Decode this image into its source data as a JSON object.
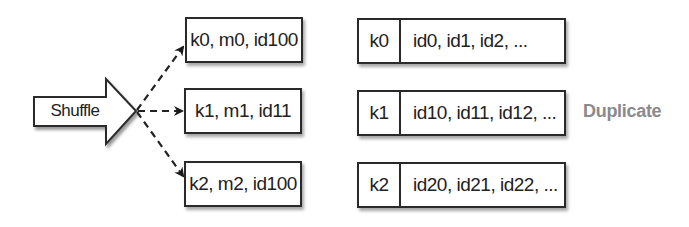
{
  "diagram": {
    "source": {
      "label": "Shuffle",
      "shape": "block-arrow-right"
    },
    "connectors": {
      "style": "dashed",
      "color": "#222222",
      "targets": [
        "record-0",
        "record-1",
        "record-2"
      ]
    },
    "records": [
      {
        "id": "record-0",
        "label": "k0, m0, id100"
      },
      {
        "id": "record-1",
        "label": "k1, m1, id11"
      },
      {
        "id": "record-2",
        "label": "k2, m2, id100"
      }
    ],
    "groups": [
      {
        "key": "k0",
        "values": "id0, id1, id2, ..."
      },
      {
        "key": "k1",
        "values": "id10, id11, id12, ..."
      },
      {
        "key": "k2",
        "values": "id20, id21, id22, ..."
      }
    ],
    "annotation": {
      "label": "Duplicate",
      "color": "#8a8a8a",
      "row": 1
    }
  }
}
